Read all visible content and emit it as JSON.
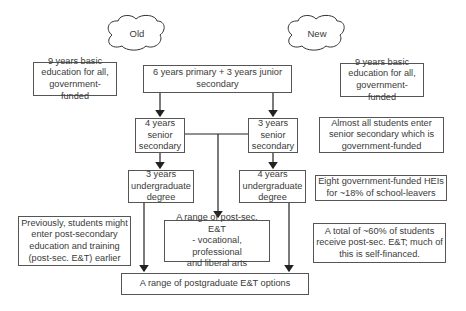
{
  "headers": {
    "old": "Old",
    "new": "New"
  },
  "old_side": {
    "basic": "9 years basic\neducation for all,\ngovernment-funded",
    "previous_note": "Previously, students might\nenter post-secondary\neducation and training\n(post-sec. E&T) earlier"
  },
  "center": {
    "primary": "6 years primary + 3 years junior\nsecondary",
    "old_senior": "4 years\nsenior\nsecondary",
    "new_senior": "3 years\nsenior\nsecondary",
    "old_undergrad": "3 years\nundergraduate\ndegree",
    "new_undergrad": "4 years\nundergraduate\ndegree",
    "post_sec": "A range of post-sec. E&T\n- vocational, professional\nand liberal arts",
    "postgrad": "A range of postgraduate E&T options"
  },
  "new_side": {
    "basic": "9 years basic\neducation for all,\ngovernment-funded",
    "senior_note": "Almost all students enter\nsenior secondary which is\ngovernment-funded",
    "hei_note": "Eight government-funded HEIs\nfor ~18% of school-leavers",
    "total_note": "A total of ~60% of students\nreceive post-sec. E&T; much of\nthis is self-financed."
  }
}
